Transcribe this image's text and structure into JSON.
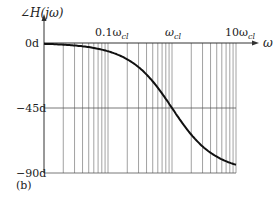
{
  "figure": {
    "panel_label": "(b)",
    "ylabel": "∠H(jω)",
    "xlabel": "ω"
  },
  "chart_data": {
    "type": "line",
    "title": "",
    "panel": "(b)",
    "xlabel": "ω",
    "ylabel": "∠H(jω)",
    "xscale": "log",
    "xlim": [
      "0.01ω_cl",
      "10ω_cl"
    ],
    "x_ticks": [
      "0.1ω_cl",
      "ω_cl",
      "10ω_cl"
    ],
    "y_ticks": [
      "0d",
      "-45d",
      "-90d"
    ],
    "ylim": [
      -90,
      0
    ],
    "grid": true,
    "series": [
      {
        "name": "phase",
        "x_over_wcl": [
          0.01,
          0.02,
          0.05,
          0.1,
          0.2,
          0.5,
          1,
          2,
          5,
          10
        ],
        "y_deg": [
          -0.6,
          -1.1,
          -2.9,
          -5.7,
          -11.3,
          -26.6,
          -45,
          -63.4,
          -78.7,
          -84.3
        ]
      }
    ]
  },
  "ticks": {
    "y": [
      "0d",
      "−45d",
      "−90d"
    ],
    "x0": "0.1ω",
    "x0sub": "cl",
    "x1": "ω",
    "x1sub": "cl",
    "x2": "10ω",
    "x2sub": "cl"
  }
}
